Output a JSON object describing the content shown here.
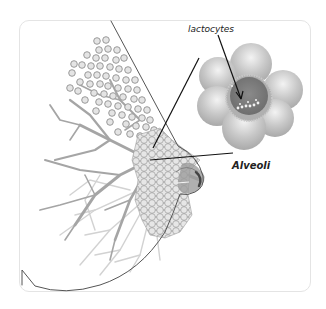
{
  "diagram": {
    "labels": {
      "lactocytes": "lactocytes",
      "alveoli": "Alveoli"
    },
    "colors": {
      "card_border": "#e4e4e4",
      "outline": "#555555",
      "duct": "#a8a8a8",
      "duct_light": "#d0d0d0",
      "alveolus_ring": "#9a9a9a",
      "alveolus_fill": "#d9d9d9",
      "cluster_outer": "#bdbdbd",
      "cluster_center": "#7a7a7a",
      "leader_line": "#111111",
      "nipple": "#6a6a6a"
    },
    "components": [
      "breast-outline",
      "milk-ducts",
      "alveoli-cluster",
      "nipple-areola",
      "alveolus-magnified",
      "lactocytes-pointer-arrow",
      "alveoli-leader-line"
    ]
  }
}
